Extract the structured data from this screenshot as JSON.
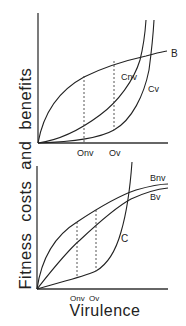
{
  "axes": {
    "y_label": "Fitness costs and benefits",
    "x_label": "Virulence"
  },
  "top_panel": {
    "curves": [
      {
        "id": "B",
        "label": "B",
        "shape": "concave benefit curve rising and leveling off"
      },
      {
        "id": "Cnv",
        "label": "Cnv",
        "shape": "convex cost curve rising steeply"
      },
      {
        "id": "Cv",
        "label": "Cv",
        "shape": "convex cost curve rising steeply, shifted right"
      }
    ],
    "markers": [
      {
        "id": "Onv",
        "label": "Onv"
      },
      {
        "id": "Ov",
        "label": "Ov"
      }
    ]
  },
  "bottom_panel": {
    "curves": [
      {
        "id": "Bnv",
        "label": "Bnv",
        "shape": "concave benefit curve, higher"
      },
      {
        "id": "Bv",
        "label": "Bv",
        "shape": "concave benefit curve, lower"
      },
      {
        "id": "C",
        "label": "C",
        "shape": "convex cost curve rising steeply"
      }
    ],
    "markers": [
      {
        "id": "Onv",
        "label": "Onv"
      },
      {
        "id": "Ov",
        "label": "Ov"
      }
    ]
  }
}
